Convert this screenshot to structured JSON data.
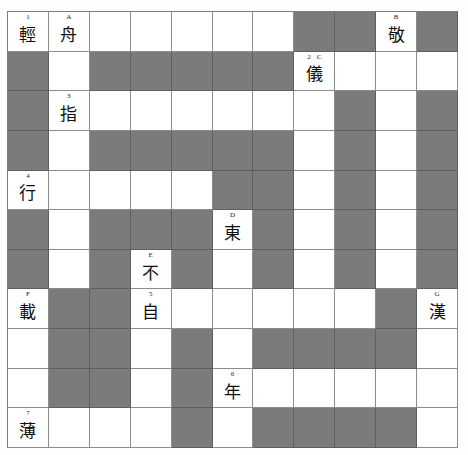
{
  "puzzle": {
    "title": "Chinese character crossword grid",
    "columns": 11,
    "rows": 11,
    "colors": {
      "block_fill": "#7b7b7b",
      "open_fill": "#ffffff",
      "grid_line": "#8c8c8c",
      "text": "#101010",
      "page_background": "#ffffff"
    },
    "cells": [
      [
        {
          "type": "open",
          "labels": [
            "1"
          ],
          "letter": "輕"
        },
        {
          "type": "open",
          "labels": [
            "A"
          ],
          "letter": "舟"
        },
        {
          "type": "open",
          "labels": [],
          "letter": ""
        },
        {
          "type": "open",
          "labels": [],
          "letter": ""
        },
        {
          "type": "open",
          "labels": [],
          "letter": ""
        },
        {
          "type": "open",
          "labels": [],
          "letter": ""
        },
        {
          "type": "open",
          "labels": [],
          "letter": ""
        },
        {
          "type": "block",
          "labels": [],
          "letter": ""
        },
        {
          "type": "block",
          "labels": [],
          "letter": ""
        },
        {
          "type": "open",
          "labels": [
            "B"
          ],
          "letter": "敬"
        },
        {
          "type": "block",
          "labels": [],
          "letter": ""
        }
      ],
      [
        {
          "type": "block",
          "labels": [],
          "letter": ""
        },
        {
          "type": "open",
          "labels": [],
          "letter": ""
        },
        {
          "type": "block",
          "labels": [],
          "letter": ""
        },
        {
          "type": "block",
          "labels": [],
          "letter": ""
        },
        {
          "type": "block",
          "labels": [],
          "letter": ""
        },
        {
          "type": "block",
          "labels": [],
          "letter": ""
        },
        {
          "type": "block",
          "labels": [],
          "letter": ""
        },
        {
          "type": "open",
          "labels": [
            "2",
            "C"
          ],
          "letter": "儀"
        },
        {
          "type": "open",
          "labels": [],
          "letter": ""
        },
        {
          "type": "open",
          "labels": [],
          "letter": ""
        },
        {
          "type": "open",
          "labels": [],
          "letter": ""
        }
      ],
      [
        {
          "type": "block",
          "labels": [],
          "letter": ""
        },
        {
          "type": "open",
          "labels": [
            "3"
          ],
          "letter": "指"
        },
        {
          "type": "open",
          "labels": [],
          "letter": ""
        },
        {
          "type": "open",
          "labels": [],
          "letter": ""
        },
        {
          "type": "open",
          "labels": [],
          "letter": ""
        },
        {
          "type": "open",
          "labels": [],
          "letter": ""
        },
        {
          "type": "open",
          "labels": [],
          "letter": ""
        },
        {
          "type": "open",
          "labels": [],
          "letter": ""
        },
        {
          "type": "block",
          "labels": [],
          "letter": ""
        },
        {
          "type": "open",
          "labels": [],
          "letter": ""
        },
        {
          "type": "block",
          "labels": [],
          "letter": ""
        }
      ],
      [
        {
          "type": "block",
          "labels": [],
          "letter": ""
        },
        {
          "type": "open",
          "labels": [],
          "letter": ""
        },
        {
          "type": "block",
          "labels": [],
          "letter": ""
        },
        {
          "type": "block",
          "labels": [],
          "letter": ""
        },
        {
          "type": "block",
          "labels": [],
          "letter": ""
        },
        {
          "type": "block",
          "labels": [],
          "letter": ""
        },
        {
          "type": "block",
          "labels": [],
          "letter": ""
        },
        {
          "type": "open",
          "labels": [],
          "letter": ""
        },
        {
          "type": "block",
          "labels": [],
          "letter": ""
        },
        {
          "type": "open",
          "labels": [],
          "letter": ""
        },
        {
          "type": "block",
          "labels": [],
          "letter": ""
        }
      ],
      [
        {
          "type": "open",
          "labels": [
            "4"
          ],
          "letter": "行"
        },
        {
          "type": "open",
          "labels": [],
          "letter": ""
        },
        {
          "type": "open",
          "labels": [],
          "letter": ""
        },
        {
          "type": "open",
          "labels": [],
          "letter": ""
        },
        {
          "type": "open",
          "labels": [],
          "letter": ""
        },
        {
          "type": "block",
          "labels": [],
          "letter": ""
        },
        {
          "type": "block",
          "labels": [],
          "letter": ""
        },
        {
          "type": "open",
          "labels": [],
          "letter": ""
        },
        {
          "type": "block",
          "labels": [],
          "letter": ""
        },
        {
          "type": "open",
          "labels": [],
          "letter": ""
        },
        {
          "type": "block",
          "labels": [],
          "letter": ""
        }
      ],
      [
        {
          "type": "block",
          "labels": [],
          "letter": ""
        },
        {
          "type": "open",
          "labels": [],
          "letter": ""
        },
        {
          "type": "block",
          "labels": [],
          "letter": ""
        },
        {
          "type": "block",
          "labels": [],
          "letter": ""
        },
        {
          "type": "block",
          "labels": [],
          "letter": ""
        },
        {
          "type": "open",
          "labels": [
            "D"
          ],
          "letter": "東"
        },
        {
          "type": "block",
          "labels": [],
          "letter": ""
        },
        {
          "type": "open",
          "labels": [],
          "letter": ""
        },
        {
          "type": "block",
          "labels": [],
          "letter": ""
        },
        {
          "type": "open",
          "labels": [],
          "letter": ""
        },
        {
          "type": "block",
          "labels": [],
          "letter": ""
        }
      ],
      [
        {
          "type": "block",
          "labels": [],
          "letter": ""
        },
        {
          "type": "open",
          "labels": [],
          "letter": ""
        },
        {
          "type": "block",
          "labels": [],
          "letter": ""
        },
        {
          "type": "open",
          "labels": [
            "E"
          ],
          "letter": "不"
        },
        {
          "type": "block",
          "labels": [],
          "letter": ""
        },
        {
          "type": "open",
          "labels": [],
          "letter": ""
        },
        {
          "type": "block",
          "labels": [],
          "letter": ""
        },
        {
          "type": "open",
          "labels": [],
          "letter": ""
        },
        {
          "type": "block",
          "labels": [],
          "letter": ""
        },
        {
          "type": "open",
          "labels": [],
          "letter": ""
        },
        {
          "type": "block",
          "labels": [],
          "letter": ""
        }
      ],
      [
        {
          "type": "open",
          "labels": [
            "F"
          ],
          "letter": "載"
        },
        {
          "type": "block",
          "labels": [],
          "letter": ""
        },
        {
          "type": "block",
          "labels": [],
          "letter": ""
        },
        {
          "type": "open",
          "labels": [
            "5"
          ],
          "letter": "自"
        },
        {
          "type": "open",
          "labels": [],
          "letter": ""
        },
        {
          "type": "open",
          "labels": [],
          "letter": ""
        },
        {
          "type": "open",
          "labels": [],
          "letter": ""
        },
        {
          "type": "open",
          "labels": [],
          "letter": ""
        },
        {
          "type": "open",
          "labels": [],
          "letter": ""
        },
        {
          "type": "block",
          "labels": [],
          "letter": ""
        },
        {
          "type": "open",
          "labels": [
            "G"
          ],
          "letter": "漢"
        }
      ],
      [
        {
          "type": "open",
          "labels": [],
          "letter": ""
        },
        {
          "type": "block",
          "labels": [],
          "letter": ""
        },
        {
          "type": "block",
          "labels": [],
          "letter": ""
        },
        {
          "type": "open",
          "labels": [],
          "letter": ""
        },
        {
          "type": "block",
          "labels": [],
          "letter": ""
        },
        {
          "type": "open",
          "labels": [],
          "letter": ""
        },
        {
          "type": "block",
          "labels": [],
          "letter": ""
        },
        {
          "type": "block",
          "labels": [],
          "letter": ""
        },
        {
          "type": "block",
          "labels": [],
          "letter": ""
        },
        {
          "type": "block",
          "labels": [],
          "letter": ""
        },
        {
          "type": "open",
          "labels": [],
          "letter": ""
        }
      ],
      [
        {
          "type": "open",
          "labels": [],
          "letter": ""
        },
        {
          "type": "block",
          "labels": [],
          "letter": ""
        },
        {
          "type": "block",
          "labels": [],
          "letter": ""
        },
        {
          "type": "open",
          "labels": [],
          "letter": ""
        },
        {
          "type": "block",
          "labels": [],
          "letter": ""
        },
        {
          "type": "open",
          "labels": [
            "6"
          ],
          "letter": "年"
        },
        {
          "type": "open",
          "labels": [],
          "letter": ""
        },
        {
          "type": "open",
          "labels": [],
          "letter": ""
        },
        {
          "type": "open",
          "labels": [],
          "letter": ""
        },
        {
          "type": "open",
          "labels": [],
          "letter": ""
        },
        {
          "type": "open",
          "labels": [],
          "letter": ""
        }
      ],
      [
        {
          "type": "open",
          "labels": [
            "7"
          ],
          "letter": "薄"
        },
        {
          "type": "open",
          "labels": [],
          "letter": ""
        },
        {
          "type": "open",
          "labels": [],
          "letter": ""
        },
        {
          "type": "open",
          "labels": [],
          "letter": ""
        },
        {
          "type": "block",
          "labels": [],
          "letter": ""
        },
        {
          "type": "open",
          "labels": [],
          "letter": ""
        },
        {
          "type": "block",
          "labels": [],
          "letter": ""
        },
        {
          "type": "block",
          "labels": [],
          "letter": ""
        },
        {
          "type": "block",
          "labels": [],
          "letter": ""
        },
        {
          "type": "block",
          "labels": [],
          "letter": ""
        },
        {
          "type": "open",
          "labels": [],
          "letter": ""
        }
      ]
    ]
  }
}
